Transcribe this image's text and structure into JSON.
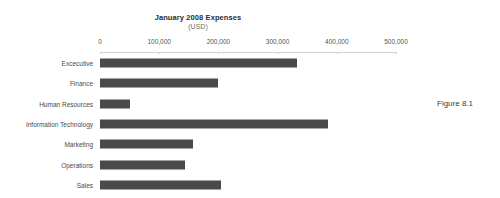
{
  "chart_data": {
    "type": "bar",
    "orientation": "horizontal",
    "title": "January 2008 Expenses",
    "subtitle": "(USD)",
    "xlabel": "",
    "ylabel": "",
    "xlim": [
      0,
      500000
    ],
    "grid": false,
    "legend": false,
    "bar_color": "#4a4a4a",
    "axis_color": "#d2d2d2",
    "x_ticks": [
      {
        "value": 0,
        "label": "0"
      },
      {
        "value": 100000,
        "label": "100,000"
      },
      {
        "value": 200000,
        "label": "200,000"
      },
      {
        "value": 300000,
        "label": "300,000"
      },
      {
        "value": 400000,
        "label": "400,000"
      },
      {
        "value": 500000,
        "label": "500,000"
      }
    ],
    "categories": [
      "Excecutive",
      "Finance",
      "Human Resources",
      "Information Technology",
      "Marketing",
      "Operations",
      "Sales"
    ],
    "values": [
      333000,
      199000,
      51000,
      385000,
      157000,
      144000,
      204000
    ]
  },
  "caption": {
    "text": "Figure 8.1"
  }
}
